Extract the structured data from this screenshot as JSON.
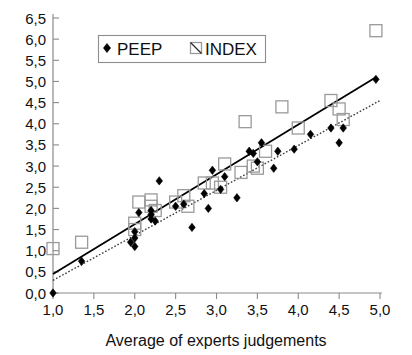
{
  "chart_data": {
    "type": "scatter",
    "title": "",
    "xlabel": "Average of experts judgements",
    "ylabel": "",
    "xlim": [
      1.0,
      5.0
    ],
    "ylim": [
      0.0,
      6.5
    ],
    "grid": false,
    "decimal_separator": ",",
    "legend_position": "top-left-inside",
    "x_ticks": [
      "1,0",
      "1,5",
      "2,0",
      "2,5",
      "3,0",
      "3,5",
      "4,0",
      "4,5",
      "5,0"
    ],
    "x_tick_values": [
      1.0,
      1.5,
      2.0,
      2.5,
      3.0,
      3.5,
      4.0,
      4.5,
      5.0
    ],
    "y_ticks": [
      "0,0",
      "0,5",
      "1,0",
      "1,5",
      "2,0",
      "2,5",
      "3,0",
      "3,5",
      "4,0",
      "4,5",
      "5,0",
      "5,5",
      "6,0",
      "6,5"
    ],
    "y_tick_values": [
      0.0,
      0.5,
      1.0,
      1.5,
      2.0,
      2.5,
      3.0,
      3.5,
      4.0,
      4.5,
      5.0,
      5.5,
      6.0,
      6.5
    ],
    "series": [
      {
        "name": "PEEP",
        "marker": "filled-diamond",
        "color": "#000000",
        "points": [
          [
            1.0,
            0.0
          ],
          [
            1.35,
            0.75
          ],
          [
            1.95,
            1.2
          ],
          [
            2.0,
            1.45
          ],
          [
            2.0,
            1.3
          ],
          [
            2.0,
            1.1
          ],
          [
            2.05,
            1.9
          ],
          [
            2.2,
            1.75
          ],
          [
            2.2,
            1.85
          ],
          [
            2.2,
            1.95
          ],
          [
            2.25,
            1.7
          ],
          [
            2.3,
            2.65
          ],
          [
            2.5,
            2.05
          ],
          [
            2.6,
            2.1
          ],
          [
            2.7,
            1.55
          ],
          [
            2.85,
            2.35
          ],
          [
            2.9,
            2.0
          ],
          [
            2.95,
            2.9
          ],
          [
            3.05,
            2.45
          ],
          [
            3.1,
            2.75
          ],
          [
            3.25,
            2.25
          ],
          [
            3.4,
            3.35
          ],
          [
            3.45,
            3.3
          ],
          [
            3.5,
            3.1
          ],
          [
            3.55,
            3.55
          ],
          [
            3.7,
            2.95
          ],
          [
            3.75,
            3.35
          ],
          [
            3.95,
            3.4
          ],
          [
            4.15,
            3.75
          ],
          [
            4.4,
            3.9
          ],
          [
            4.5,
            3.55
          ],
          [
            4.55,
            3.9
          ],
          [
            4.95,
            5.05
          ]
        ]
      },
      {
        "name": "INDEX",
        "marker": "open-square",
        "color": "#9a9a9a",
        "points": [
          [
            1.0,
            1.05
          ],
          [
            1.35,
            1.2
          ],
          [
            2.0,
            1.65
          ],
          [
            2.0,
            1.5
          ],
          [
            2.05,
            2.15
          ],
          [
            2.2,
            2.2
          ],
          [
            2.2,
            2.05
          ],
          [
            2.25,
            1.95
          ],
          [
            2.5,
            2.15
          ],
          [
            2.6,
            2.3
          ],
          [
            2.65,
            2.05
          ],
          [
            2.85,
            2.6
          ],
          [
            2.95,
            2.6
          ],
          [
            3.05,
            2.5
          ],
          [
            3.1,
            3.05
          ],
          [
            3.3,
            2.85
          ],
          [
            3.35,
            4.05
          ],
          [
            3.45,
            3.0
          ],
          [
            3.5,
            2.95
          ],
          [
            3.6,
            3.35
          ],
          [
            3.8,
            4.4
          ],
          [
            4.0,
            3.9
          ],
          [
            4.4,
            4.55
          ],
          [
            4.5,
            4.35
          ],
          [
            4.55,
            4.1
          ],
          [
            4.95,
            6.2
          ]
        ]
      }
    ],
    "trendlines": [
      {
        "name": "PEEP-fit",
        "style": "solid",
        "color": "#000000",
        "x_start": 1.0,
        "y_start": 0.45,
        "x_end": 4.95,
        "y_end": 5.1
      },
      {
        "name": "INDEX-fit",
        "style": "dotted",
        "color": "#3a3a3a",
        "x_start": 1.0,
        "y_start": 0.3,
        "x_end": 5.0,
        "y_end": 4.55
      }
    ],
    "legend": [
      {
        "label": "PEEP",
        "marker": "filled-diamond"
      },
      {
        "label": "INDEX",
        "marker": "open-square"
      }
    ]
  }
}
